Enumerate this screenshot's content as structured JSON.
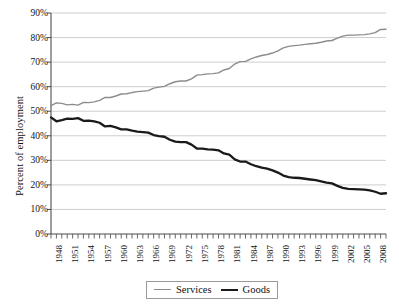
{
  "chart_data": {
    "type": "line",
    "title": "",
    "xlabel": "",
    "ylabel": "Percent of employment",
    "ylim": [
      0,
      90
    ],
    "ytick_labels": [
      "90%",
      "80%",
      "70%",
      "60%",
      "50%",
      "40%",
      "30%",
      "20%",
      "10%",
      "0%"
    ],
    "ytick_values": [
      90,
      80,
      70,
      60,
      50,
      40,
      30,
      20,
      10,
      0
    ],
    "grid": "horizontal",
    "legend_position": "bottom",
    "xtick_labels": [
      "1948",
      "1951",
      "1954",
      "1957",
      "1960",
      "1963",
      "1966",
      "1969",
      "1972",
      "1975",
      "1978",
      "1981",
      "1984",
      "1987",
      "1990",
      "1993",
      "1996",
      "1999",
      "2002",
      "2005",
      "2008"
    ],
    "xtick_values": [
      1948,
      1951,
      1954,
      1957,
      1960,
      1963,
      1966,
      1969,
      1972,
      1975,
      1978,
      1981,
      1984,
      1987,
      1990,
      1993,
      1996,
      1999,
      2002,
      2005,
      2008
    ],
    "xlim": [
      1948,
      2010
    ],
    "x": [
      1948,
      1949,
      1950,
      1951,
      1952,
      1953,
      1954,
      1955,
      1956,
      1957,
      1958,
      1959,
      1960,
      1961,
      1962,
      1963,
      1964,
      1965,
      1966,
      1967,
      1968,
      1969,
      1970,
      1971,
      1972,
      1973,
      1974,
      1975,
      1976,
      1977,
      1978,
      1979,
      1980,
      1981,
      1982,
      1983,
      1984,
      1985,
      1986,
      1987,
      1988,
      1989,
      1990,
      1991,
      1992,
      1993,
      1994,
      1995,
      1996,
      1997,
      1998,
      1999,
      2000,
      2001,
      2002,
      2003,
      2004,
      2005,
      2006,
      2007,
      2008,
      2009,
      2010
    ],
    "series": [
      {
        "name": "Services",
        "color": "#8c8c8c",
        "width": 1.4,
        "values": [
          52.3,
          53.4,
          53.2,
          52.6,
          52.8,
          52.5,
          53.6,
          53.5,
          53.8,
          54.4,
          55.6,
          55.6,
          56.2,
          57.0,
          57.1,
          57.6,
          58.0,
          58.2,
          58.4,
          59.4,
          59.8,
          60.1,
          61.2,
          62.0,
          62.3,
          62.3,
          63.2,
          64.7,
          64.9,
          65.2,
          65.3,
          65.6,
          66.8,
          67.4,
          69.2,
          70.2,
          70.3,
          71.3,
          72.1,
          72.7,
          73.1,
          73.7,
          74.6,
          75.8,
          76.4,
          76.7,
          76.9,
          77.2,
          77.5,
          77.7,
          78.1,
          78.6,
          78.8,
          79.8,
          80.6,
          81.0,
          81.0,
          81.1,
          81.2,
          81.5,
          82.0,
          83.3,
          83.4
        ]
      },
      {
        "name": "Goods",
        "color": "#1a1a1a",
        "width": 2.3,
        "values": [
          47.5,
          45.9,
          46.4,
          47.0,
          46.9,
          47.2,
          46.1,
          46.2,
          45.9,
          45.3,
          43.8,
          44.0,
          43.4,
          42.6,
          42.6,
          42.1,
          41.7,
          41.5,
          41.3,
          40.3,
          39.9,
          39.6,
          38.4,
          37.6,
          37.4,
          37.4,
          36.4,
          34.8,
          34.8,
          34.5,
          34.4,
          34.1,
          32.8,
          32.3,
          30.4,
          29.5,
          29.5,
          28.4,
          27.6,
          27.0,
          26.6,
          25.9,
          25.0,
          23.8,
          23.2,
          22.9,
          22.8,
          22.5,
          22.2,
          21.9,
          21.4,
          20.9,
          20.6,
          19.6,
          18.8,
          18.4,
          18.3,
          18.2,
          18.1,
          17.8,
          17.2,
          16.4,
          16.6
        ]
      }
    ]
  }
}
